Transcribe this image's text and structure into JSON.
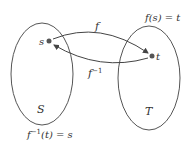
{
  "diagram": {
    "sets": [
      {
        "name": "S",
        "label": "S"
      },
      {
        "name": "T",
        "label": "T"
      }
    ],
    "elements": [
      {
        "name": "s",
        "label": "s",
        "set": "S"
      },
      {
        "name": "t",
        "label": "t",
        "set": "T"
      }
    ],
    "arrows": [
      {
        "from": "s",
        "to": "t",
        "label": "f"
      },
      {
        "from": "t",
        "to": "s",
        "label": "f",
        "sup": "−1"
      }
    ],
    "annotations": {
      "forward": {
        "pre": "f(s) = t"
      },
      "inverse": {
        "f": "f",
        "sup": "−1",
        "rest": "(t) = s"
      }
    },
    "colors": {
      "stroke": "#444444",
      "dot": "#555555",
      "text": "#333333"
    }
  }
}
